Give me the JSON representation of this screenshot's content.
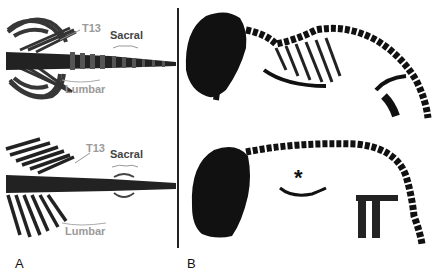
{
  "figure": {
    "panels": [
      {
        "label": "A",
        "description": "Dorsal views of vertebral column",
        "images": [
          {
            "annotations": {
              "t13": "T13",
              "sacral": "Sacral",
              "lumbar": "Lumbar"
            }
          },
          {
            "annotations": {
              "t13": "T13",
              "sacral": "Sacral",
              "lumbar": "Lumbar"
            }
          }
        ]
      },
      {
        "label": "B",
        "description": "Lateral views of skeletons",
        "images": [
          {
            "annotations": {}
          },
          {
            "annotations": {
              "asterisk": "*"
            }
          }
        ]
      }
    ],
    "colors": {
      "bone": "#111111",
      "annotation_gray": "#9a9a9a",
      "annotation_dark": "#444444",
      "background": "#ffffff"
    }
  }
}
